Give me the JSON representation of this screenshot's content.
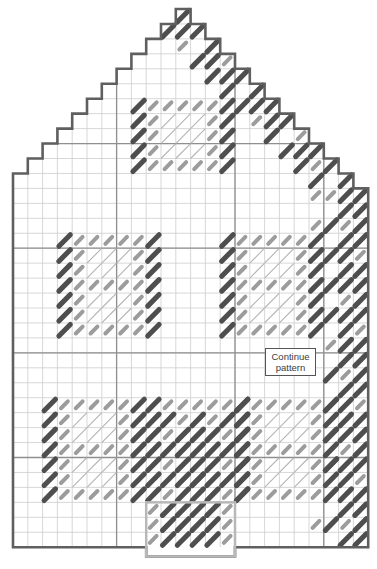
{
  "label_box": {
    "line1": "Continue",
    "line2": "pattern"
  },
  "colors": {
    "background": "#ffffff",
    "outline": "#5f5f5f",
    "door_outline": "#b8b8b8",
    "grid_minor": "#cdcdcd",
    "grid_accent": "#8f8f8f",
    "dark_stitch": "#4e4e4e",
    "gray_stitch": "#9c9c9c",
    "light_stitch": "#b4b4b4",
    "label_border": "#555555",
    "label_text": "#3c3c3c"
  },
  "grid": {
    "cols": 24,
    "rows": 36,
    "cell_w": 14.8,
    "cell_h": 14.95,
    "origin_x": 13,
    "origin_y": 9,
    "accent_cols": [
      7,
      15,
      21
    ],
    "accent_rows": [
      9,
      16,
      23,
      30
    ]
  },
  "house": {
    "apex_col": 11,
    "roof_rows": 12,
    "right_extra_step_row": 12
  },
  "pattern": {
    "blocks": [
      {
        "type": "plaid5",
        "col": 8,
        "row": 6,
        "cols": 7,
        "rows": 5
      },
      {
        "type": "plaid7",
        "col": 3,
        "row": 15,
        "cols": 7,
        "rows": 7
      },
      {
        "type": "plaid7",
        "col": 14,
        "row": 15,
        "cols": 7,
        "rows": 7
      },
      {
        "type": "plaid7",
        "col": 2,
        "row": 26,
        "cols": 7,
        "rows": 7
      },
      {
        "type": "checker",
        "col": 9,
        "row": 26,
        "cols": 7,
        "rows": 7
      },
      {
        "type": "plaid7",
        "col": 15,
        "row": 26,
        "cols": 7,
        "rows": 7
      }
    ],
    "roof_band": {
      "row_start": 0,
      "row_end": 11,
      "thickness": 3
    },
    "wall_band": {
      "col_start": 21,
      "col_end": 23,
      "row_start": 12,
      "row_end": 35
    },
    "extra_gray_cells": [
      [
        12,
        20
      ],
      [
        14,
        20
      ],
      [
        34,
        20
      ]
    ],
    "door": {
      "col": 9,
      "row": 33,
      "cols": 6,
      "rows": 3,
      "drop_px": 9.2,
      "gray_edge_cols": [
        9,
        14
      ],
      "dark_cols": [
        10,
        11,
        12,
        13
      ],
      "connector_rows": [
        31,
        32
      ],
      "connector_cols": [
        11,
        12,
        13
      ]
    }
  }
}
